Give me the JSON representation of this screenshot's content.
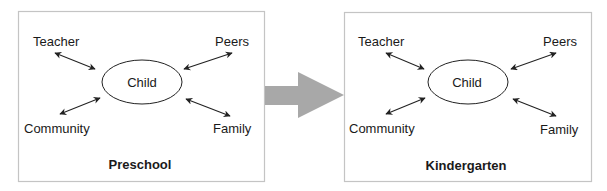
{
  "diagram": {
    "transition_arrow": {
      "color": "#a8a8a8",
      "direction": "left-to-right"
    },
    "panels": [
      {
        "title": "Preschool",
        "center": "Child",
        "nodes": {
          "top_left": "Teacher",
          "top_right": "Peers",
          "bottom_left": "Community",
          "bottom_right": "Family"
        }
      },
      {
        "title": "Kindergarten",
        "center": "Child",
        "nodes": {
          "top_left": "Teacher",
          "top_right": "Peers",
          "bottom_left": "Community",
          "bottom_right": "Family"
        }
      }
    ],
    "colors": {
      "border": "#c4c4c4",
      "line": "#222222",
      "text": "#1a1a1a",
      "big_arrow": "#a8a8a8"
    }
  }
}
